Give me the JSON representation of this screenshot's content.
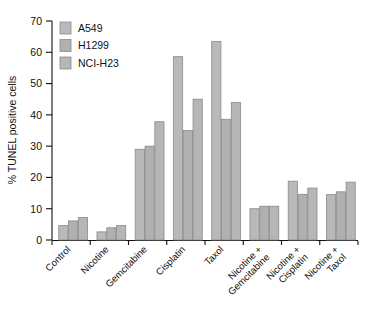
{
  "chart_data": {
    "type": "bar",
    "title": "",
    "xlabel": "",
    "ylabel": "% TUNEL positive cells",
    "ylim": [
      0,
      70
    ],
    "yticks": [
      0,
      10,
      20,
      30,
      40,
      50,
      60,
      70
    ],
    "grid": false,
    "legend_position": "top-left",
    "categories": [
      "Control",
      "Nicotine",
      "Gemcitabine",
      "Cisplatin",
      "Taxol",
      "Nicotine +\nGemcitabine",
      "Nicotine +\nCisplatin",
      "Nicotine +\nTaxol"
    ],
    "series": [
      {
        "name": "A549",
        "color": "#b9b9b9",
        "values": [
          4.6,
          2.6,
          29.0,
          58.6,
          63.5,
          10.0,
          18.8,
          14.5
        ]
      },
      {
        "name": "H1299",
        "color": "#b0b0b0",
        "values": [
          6.1,
          3.9,
          30.0,
          35.0,
          38.6,
          10.8,
          14.6,
          15.4
        ]
      },
      {
        "name": "NCI-H23",
        "color": "#b6b6b6",
        "values": [
          7.2,
          4.6,
          37.8,
          45.0,
          44.0,
          10.8,
          16.6,
          18.5
        ]
      }
    ]
  },
  "axis": {
    "y_tick_labels": [
      "0",
      "10",
      "20",
      "30",
      "40",
      "50",
      "60",
      "70"
    ],
    "y_axis_title": "% TUNEL positive cells"
  },
  "legend": {
    "entries": [
      {
        "label": "A549"
      },
      {
        "label": "H1299"
      },
      {
        "label": "NCI-H23"
      }
    ]
  },
  "categories_display": [
    {
      "line1": "Control",
      "line2": ""
    },
    {
      "line1": "Nicotine",
      "line2": ""
    },
    {
      "line1": "Gemcitabine",
      "line2": ""
    },
    {
      "line1": "Cisplatin",
      "line2": ""
    },
    {
      "line1": "Taxol",
      "line2": ""
    },
    {
      "line1": "Nicotine +",
      "line2": "Gemcitabine"
    },
    {
      "line1": "Nicotine +",
      "line2": "Cisplatin"
    },
    {
      "line1": "Nicotine +",
      "line2": "Taxol"
    }
  ]
}
